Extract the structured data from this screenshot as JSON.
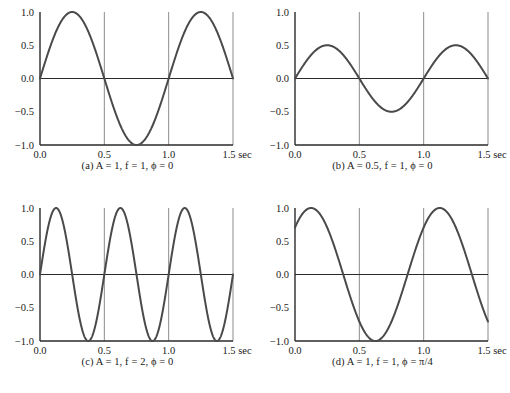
{
  "figure": {
    "type": "multi-panel-line-chart",
    "panel_count": 4,
    "background_color": "#ffffff",
    "curve_color": "#4a4a4a",
    "axis_color": "#2a2a2a",
    "grid_color": "#808080"
  },
  "axes": {
    "ytick_labels": [
      "1.0",
      "0.5",
      "0.0",
      "−0.5",
      "−1.0"
    ],
    "ytick_values": [
      1.0,
      0.5,
      0.0,
      -0.5,
      -1.0
    ],
    "xtick_labels": [
      "0.0",
      "0.5",
      "1.0",
      "1.5 sec"
    ],
    "xtick_values": [
      0.0,
      0.5,
      1.0,
      1.5
    ],
    "xlabel": "sec",
    "ylabel": "",
    "xlim": [
      0.0,
      1.5
    ],
    "ylim": [
      -1.0,
      1.0
    ],
    "gridlines_x": [
      0.5,
      1.0,
      1.5
    ],
    "zero_line": true
  },
  "captions": {
    "a": "(a) A = 1, f = 1,  ϕ = 0",
    "b": "(b) A = 0.5, f = 1,  ϕ = 0",
    "c": "(c) A = 1, f = 2,  ϕ = 0",
    "d": "(d) A = 1, f = 1,  ϕ = π/4"
  },
  "chart_data": [
    {
      "type": "line",
      "id": "a",
      "title": "(a) A = 1, f = 1,  ϕ = 0",
      "equation": "y = A sin(2πft + ϕ)",
      "amplitude": 1,
      "frequency": 1,
      "phase": 0,
      "phase_label": "0",
      "xlabel": "sec",
      "ylabel": "",
      "xlim": [
        0.0,
        1.5
      ],
      "ylim": [
        -1.0,
        1.0
      ],
      "xticks": [
        0.0,
        0.5,
        1.0,
        1.5
      ],
      "xtick_labels": [
        "0.0",
        "0.5",
        "1.0",
        "1.5 sec"
      ],
      "yticks": [
        -1.0,
        -0.5,
        0.0,
        0.5,
        1.0
      ],
      "ytick_labels": [
        "−1.0",
        "−0.5",
        "0.0",
        "0.5",
        "1.0"
      ],
      "grid": true,
      "legend": false,
      "x": [
        0.0,
        0.125,
        0.25,
        0.375,
        0.5,
        0.625,
        0.75,
        0.875,
        1.0,
        1.125,
        1.25,
        1.375,
        1.5
      ],
      "y": [
        0.0,
        0.707,
        1.0,
        0.707,
        0.0,
        -0.707,
        -1.0,
        -0.707,
        0.0,
        0.707,
        1.0,
        0.707,
        0.0
      ]
    },
    {
      "type": "line",
      "id": "b",
      "title": "(b) A = 0.5, f = 1,  ϕ = 0",
      "equation": "y = A sin(2πft + ϕ)",
      "amplitude": 0.5,
      "frequency": 1,
      "phase": 0,
      "phase_label": "0",
      "xlabel": "sec",
      "ylabel": "",
      "xlim": [
        0.0,
        1.5
      ],
      "ylim": [
        -1.0,
        1.0
      ],
      "xticks": [
        0.0,
        0.5,
        1.0,
        1.5
      ],
      "xtick_labels": [
        "0.0",
        "0.5",
        "1.0",
        "1.5 sec"
      ],
      "yticks": [
        -1.0,
        -0.5,
        0.0,
        0.5,
        1.0
      ],
      "ytick_labels": [
        "−1.0",
        "−0.5",
        "0.0",
        "0.5",
        "1.0"
      ],
      "grid": true,
      "legend": false,
      "x": [
        0.0,
        0.125,
        0.25,
        0.375,
        0.5,
        0.625,
        0.75,
        0.875,
        1.0,
        1.125,
        1.25,
        1.375,
        1.5
      ],
      "y": [
        0.0,
        0.354,
        0.5,
        0.354,
        0.0,
        -0.354,
        -0.5,
        -0.354,
        0.0,
        0.354,
        0.5,
        0.354,
        0.0
      ]
    },
    {
      "type": "line",
      "id": "c",
      "title": "(c) A = 1, f = 2,  ϕ = 0",
      "equation": "y = A sin(2πft + ϕ)",
      "amplitude": 1,
      "frequency": 2,
      "phase": 0,
      "phase_label": "0",
      "xlabel": "sec",
      "ylabel": "",
      "xlim": [
        0.0,
        1.5
      ],
      "ylim": [
        -1.0,
        1.0
      ],
      "xticks": [
        0.0,
        0.5,
        1.0,
        1.5
      ],
      "xtick_labels": [
        "0.0",
        "0.5",
        "1.0",
        "1.5 sec"
      ],
      "yticks": [
        -1.0,
        -0.5,
        0.0,
        0.5,
        1.0
      ],
      "ytick_labels": [
        "−1.0",
        "−0.5",
        "0.0",
        "0.5",
        "1.0"
      ],
      "grid": true,
      "legend": false,
      "x": [
        0.0,
        0.0625,
        0.125,
        0.1875,
        0.25,
        0.3125,
        0.375,
        0.4375,
        0.5,
        0.5625,
        0.625,
        0.6875,
        0.75,
        0.8125,
        0.875,
        0.9375,
        1.0,
        1.0625,
        1.125,
        1.1875,
        1.25,
        1.3125,
        1.375,
        1.4375,
        1.5
      ],
      "y": [
        0.0,
        0.707,
        1.0,
        0.707,
        0.0,
        -0.707,
        -1.0,
        -0.707,
        0.0,
        0.707,
        1.0,
        0.707,
        0.0,
        -0.707,
        -1.0,
        -0.707,
        0.0,
        0.707,
        1.0,
        0.707,
        0.0,
        -0.707,
        -1.0,
        -0.707,
        0.0
      ]
    },
    {
      "type": "line",
      "id": "d",
      "title": "(d) A = 1, f = 1,  ϕ = π/4",
      "equation": "y = A sin(2πft + ϕ)",
      "amplitude": 1,
      "frequency": 1,
      "phase": 0.7853981634,
      "phase_label": "π/4",
      "xlabel": "sec",
      "ylabel": "",
      "xlim": [
        0.0,
        1.5
      ],
      "ylim": [
        -1.0,
        1.0
      ],
      "xticks": [
        0.0,
        0.5,
        1.0,
        1.5
      ],
      "xtick_labels": [
        "0.0",
        "0.5",
        "1.0",
        "1.5 sec"
      ],
      "yticks": [
        -1.0,
        -0.5,
        0.0,
        0.5,
        1.0
      ],
      "ytick_labels": [
        "−1.0",
        "−0.5",
        "0.0",
        "0.5",
        "1.0"
      ],
      "grid": true,
      "legend": false,
      "x": [
        0.0,
        0.125,
        0.25,
        0.375,
        0.5,
        0.625,
        0.75,
        0.875,
        1.0,
        1.125,
        1.25,
        1.375,
        1.5
      ],
      "y": [
        0.707,
        1.0,
        0.707,
        0.0,
        -0.707,
        -1.0,
        -0.707,
        0.0,
        0.707,
        1.0,
        0.707,
        0.0,
        -0.707
      ]
    }
  ]
}
